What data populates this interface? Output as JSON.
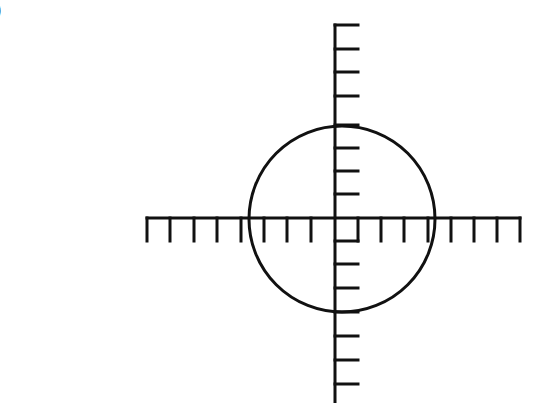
{
  "figure": {
    "corner_label": ")",
    "colors": {
      "stroke": "#111111",
      "background": "#ffffff"
    }
  },
  "axes": {
    "origin": {
      "x": 335,
      "y": 218
    },
    "tick_spacing": 23.3,
    "tick_length": 23,
    "stroke_width": 3,
    "x_axis": {
      "from": 147,
      "to": 520,
      "ticks_x": [
        147,
        170,
        194,
        217,
        241,
        264,
        287,
        311,
        381,
        404,
        428,
        451,
        474,
        497,
        520
      ]
    },
    "y_axis": {
      "from": 25,
      "to": 403,
      "ticks_y": [
        25,
        49,
        72,
        96,
        125,
        148,
        171,
        194,
        264,
        288,
        312,
        336,
        360,
        384
      ]
    },
    "unit_square": {
      "x": 335,
      "y": 218,
      "size": 23
    }
  },
  "circle": {
    "cx": 342,
    "cy": 219,
    "r": 93,
    "stroke_width": 3
  }
}
